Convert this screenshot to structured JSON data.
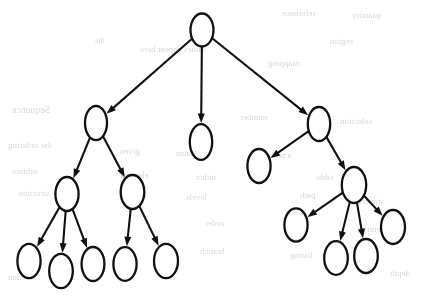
{
  "figure": {
    "kind": "rooted-tree",
    "node_count": 16,
    "edge_count": 15,
    "max_depth": 4,
    "canvas": {
      "width": 421,
      "height": 299
    },
    "colors": {
      "background": "#ffffff",
      "stroke": "#111111",
      "node_fill": "#ffffff",
      "bleed_text": "#b9b9bb"
    },
    "node_label": "",
    "stroke_width": 2.3,
    "edge_stroke_width": 2.1
  },
  "nodes": [
    {
      "id": "n0",
      "label": "",
      "cx": 202,
      "cy": 30,
      "rx": 11.5,
      "ry": 16.5,
      "level": 0,
      "role": "root"
    },
    {
      "id": "n1",
      "label": "",
      "cx": 96,
      "cy": 123,
      "rx": 11.0,
      "ry": 17.0,
      "level": 1,
      "role": "internal"
    },
    {
      "id": "n2",
      "label": "",
      "cx": 201,
      "cy": 142,
      "rx": 11.2,
      "ry": 17.8,
      "level": 1,
      "role": "leaf"
    },
    {
      "id": "n3",
      "label": "",
      "cx": 319,
      "cy": 124,
      "rx": 11.2,
      "ry": 17.0,
      "level": 1,
      "role": "internal"
    },
    {
      "id": "n4",
      "label": "",
      "cx": 67,
      "cy": 194,
      "rx": 11.6,
      "ry": 17.0,
      "level": 2,
      "role": "internal"
    },
    {
      "id": "n5",
      "label": "",
      "cx": 132.5,
      "cy": 192,
      "rx": 11.8,
      "ry": 17.0,
      "level": 2,
      "role": "internal"
    },
    {
      "id": "n6",
      "label": "",
      "cx": 259,
      "cy": 166,
      "rx": 11.6,
      "ry": 17.0,
      "level": 2,
      "role": "leaf"
    },
    {
      "id": "n7",
      "label": "",
      "cx": 354,
      "cy": 185,
      "rx": 12.2,
      "ry": 18.0,
      "level": 2,
      "role": "internal"
    },
    {
      "id": "n8",
      "label": "",
      "cx": 29,
      "cy": 261,
      "rx": 11.6,
      "ry": 17.2,
      "level": 3,
      "role": "leaf"
    },
    {
      "id": "n9",
      "label": "",
      "cx": 61,
      "cy": 271,
      "rx": 11.8,
      "ry": 17.2,
      "level": 3,
      "role": "leaf"
    },
    {
      "id": "n10",
      "label": "",
      "cx": 93,
      "cy": 264,
      "rx": 11.4,
      "ry": 17.0,
      "level": 3,
      "role": "leaf"
    },
    {
      "id": "n11",
      "label": "",
      "cx": 125,
      "cy": 264,
      "rx": 11.6,
      "ry": 16.8,
      "level": 3,
      "role": "leaf"
    },
    {
      "id": "n12",
      "label": "",
      "cx": 166,
      "cy": 261,
      "rx": 12.0,
      "ry": 17.2,
      "level": 3,
      "role": "leaf"
    },
    {
      "id": "n13",
      "label": "",
      "cx": 296,
      "cy": 225,
      "rx": 11.6,
      "ry": 16.6,
      "level": 3,
      "role": "leaf"
    },
    {
      "id": "n14",
      "label": "",
      "cx": 336,
      "cy": 258,
      "rx": 11.8,
      "ry": 16.8,
      "level": 3,
      "role": "leaf"
    },
    {
      "id": "n15",
      "label": "",
      "cx": 366,
      "cy": 256,
      "rx": 11.8,
      "ry": 17.0,
      "level": 3,
      "role": "leaf"
    },
    {
      "id": "n16",
      "label": "",
      "cx": 393,
      "cy": 227,
      "rx": 12.0,
      "ry": 17.0,
      "level": 3,
      "role": "leaf"
    }
  ],
  "edges": [
    {
      "from": "n0",
      "to": "n1",
      "arrow": true
    },
    {
      "from": "n0",
      "to": "n2",
      "arrow": true
    },
    {
      "from": "n0",
      "to": "n3",
      "arrow": true
    },
    {
      "from": "n1",
      "to": "n4",
      "arrow": true
    },
    {
      "from": "n1",
      "to": "n5",
      "arrow": true
    },
    {
      "from": "n3",
      "to": "n6",
      "arrow": true
    },
    {
      "from": "n3",
      "to": "n7",
      "arrow": true
    },
    {
      "from": "n4",
      "to": "n8",
      "arrow": true
    },
    {
      "from": "n4",
      "to": "n9",
      "arrow": true
    },
    {
      "from": "n4",
      "to": "n10",
      "arrow": true
    },
    {
      "from": "n5",
      "to": "n11",
      "arrow": true
    },
    {
      "from": "n5",
      "to": "n12",
      "arrow": true
    },
    {
      "from": "n7",
      "to": "n13",
      "arrow": true
    },
    {
      "from": "n7",
      "to": "n14",
      "arrow": true
    },
    {
      "from": "n7",
      "to": "n15",
      "arrow": true
    },
    {
      "from": "n7",
      "to": "n16",
      "arrow": true
    }
  ],
  "bleed_through": {
    "note": "Faint illegible mirrored text bleeding through from the reverse page of the scan",
    "marks": [
      {
        "text": "reference",
        "x": 282,
        "y": 8,
        "size": 9
      },
      {
        "text": "quantity",
        "x": 352,
        "y": 10,
        "size": 9
      },
      {
        "text": "the",
        "x": 95,
        "y": 36,
        "size": 8
      },
      {
        "text": "values appear here",
        "x": 140,
        "y": 44,
        "size": 9
      },
      {
        "text": "region",
        "x": 330,
        "y": 36,
        "size": 9
      },
      {
        "text": "mapping",
        "x": 268,
        "y": 58,
        "size": 9
      },
      {
        "text": "Sequence",
        "x": 12,
        "y": 104,
        "size": 10
      },
      {
        "text": "number",
        "x": 240,
        "y": 112,
        "size": 9
      },
      {
        "text": "selection",
        "x": 340,
        "y": 116,
        "size": 9
      },
      {
        "text": "the ordering",
        "x": 8,
        "y": 140,
        "size": 9
      },
      {
        "text": "given",
        "x": 120,
        "y": 146,
        "size": 9
      },
      {
        "text": "contains",
        "x": 176,
        "y": 148,
        "size": 9
      },
      {
        "text": "a node",
        "x": 268,
        "y": 150,
        "size": 9
      },
      {
        "text": "subtree",
        "x": 12,
        "y": 166,
        "size": 9
      },
      {
        "text": "element",
        "x": 120,
        "y": 170,
        "size": 9
      },
      {
        "text": "index",
        "x": 196,
        "y": 172,
        "size": 9
      },
      {
        "text": "table",
        "x": 316,
        "y": 172,
        "size": 9
      },
      {
        "text": "structure",
        "x": 18,
        "y": 188,
        "size": 9
      },
      {
        "text": "levels",
        "x": 186,
        "y": 192,
        "size": 9
      },
      {
        "text": "path",
        "x": 300,
        "y": 190,
        "size": 9
      },
      {
        "text": "traversal",
        "x": 352,
        "y": 196,
        "size": 9
      },
      {
        "text": "order",
        "x": 205,
        "y": 218,
        "size": 9
      },
      {
        "text": "entry",
        "x": 362,
        "y": 224,
        "size": 9
      },
      {
        "text": "branch",
        "x": 200,
        "y": 246,
        "size": 9
      },
      {
        "text": "listing",
        "x": 290,
        "y": 250,
        "size": 9
      },
      {
        "text": "section",
        "x": 8,
        "y": 272,
        "size": 9
      },
      {
        "text": "depth",
        "x": 390,
        "y": 268,
        "size": 9
      }
    ]
  }
}
